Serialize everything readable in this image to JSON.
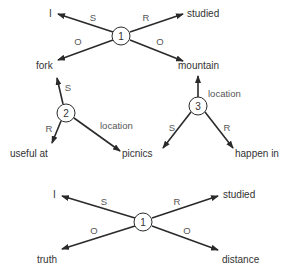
{
  "diagram": {
    "top_proposition": {
      "node": "1",
      "edges": [
        {
          "rel": "S",
          "target": "I"
        },
        {
          "rel": "R",
          "target": "studied"
        },
        {
          "rel": "O",
          "target": "fork"
        },
        {
          "rel": "O",
          "target": "mountain"
        }
      ]
    },
    "proposition_2": {
      "node": "2",
      "edges": [
        {
          "rel": "S",
          "target": "fork"
        },
        {
          "rel": "R",
          "target": "useful at"
        },
        {
          "rel": "location",
          "target": "picnics"
        }
      ]
    },
    "proposition_3": {
      "node": "3",
      "edges": [
        {
          "rel": "location",
          "target": "mountain"
        },
        {
          "rel": "S",
          "target": "picnics"
        },
        {
          "rel": "R",
          "target": "happen in"
        }
      ]
    },
    "bottom_proposition": {
      "node": "1",
      "edges": [
        {
          "rel": "S",
          "target": "I"
        },
        {
          "rel": "R",
          "target": "studied"
        },
        {
          "rel": "O",
          "target": "truth"
        },
        {
          "rel": "O",
          "target": "distance"
        }
      ]
    }
  }
}
